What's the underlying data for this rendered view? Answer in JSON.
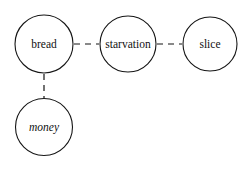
{
  "diagram": {
    "background_color": "#ffffff",
    "stroke_color": "#151515",
    "text_color": "#111111",
    "width": 251,
    "height": 169
  },
  "nodes": [
    {
      "id": "bread",
      "label": "bread",
      "cx": 44,
      "cy": 44,
      "r": 29,
      "font_size": 11.5,
      "font_style": "normal"
    },
    {
      "id": "starvation",
      "label": "starvation",
      "cx": 128,
      "cy": 44,
      "r": 28,
      "font_size": 11.5,
      "font_style": "normal"
    },
    {
      "id": "slice",
      "label": "slice",
      "cx": 210,
      "cy": 44,
      "r": 27,
      "font_size": 11.5,
      "font_style": "normal"
    },
    {
      "id": "money",
      "label": "money",
      "cx": 44,
      "cy": 127,
      "r": 28.5,
      "font_size": 11.5,
      "font_style": "italic"
    }
  ],
  "edges": [
    {
      "id": "bread-starvation",
      "from": "bread",
      "to": "starvation",
      "x1": 74,
      "y1": 44,
      "x2": 99,
      "y2": 44,
      "style": "dashed",
      "dash_pattern": "6 5"
    },
    {
      "id": "starvation-slice",
      "from": "starvation",
      "to": "slice",
      "x1": 157,
      "y1": 44,
      "x2": 182,
      "y2": 44,
      "style": "dashed",
      "dash_pattern": "6 5"
    },
    {
      "id": "bread-money",
      "from": "bread",
      "to": "money",
      "x1": 44,
      "y1": 74,
      "x2": 44,
      "y2": 98,
      "style": "dashed",
      "dash_pattern": "6 5"
    }
  ]
}
